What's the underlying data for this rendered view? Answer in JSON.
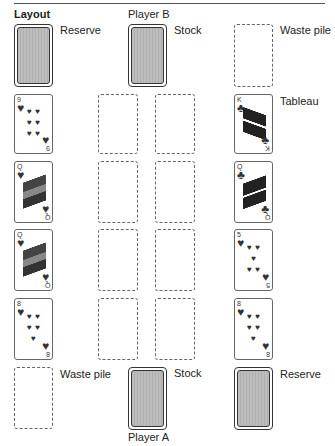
{
  "title": "Layout",
  "labels": {
    "player_b": "Player B",
    "player_a": "Player A",
    "reserve_top": "Reserve",
    "stock_top": "Stock",
    "waste_top": "Waste pile",
    "tableau": "Tableau",
    "waste_bottom": "Waste pile",
    "stock_bottom": "Stock",
    "reserve_bottom": "Reserve"
  },
  "left_column_cards": [
    {
      "rank": "9",
      "suit": "♥",
      "pips": [
        "♥",
        "♥",
        "♥",
        "♥",
        "♥",
        "♥",
        "♥"
      ]
    },
    {
      "rank": "Q",
      "suit": "♥",
      "court": true
    },
    {
      "rank": "Q",
      "suit": "♥",
      "court": true
    },
    {
      "rank": "8",
      "suit": "♥",
      "pips": [
        "♥",
        "♥",
        "♥",
        "♥",
        "♥",
        "♥"
      ]
    }
  ],
  "right_column_cards": [
    {
      "rank": "K",
      "suit": "♣",
      "court": true
    },
    {
      "rank": "Q",
      "suit": "♣",
      "court": true
    },
    {
      "rank": "5",
      "suit": "♥",
      "pips": [
        "♥",
        "♥",
        "♥",
        "♥"
      ]
    },
    {
      "rank": "8",
      "suit": "♥",
      "pips": [
        "♥",
        "♥",
        "♥",
        "♥",
        "♥",
        "♥"
      ]
    }
  ]
}
